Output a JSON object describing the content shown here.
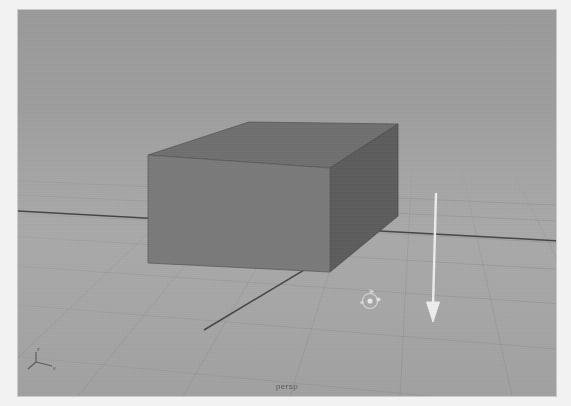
{
  "app": {
    "kind": "3d-modeling-viewport",
    "viewport_label": "persp",
    "background_color": "#a2a2a2",
    "frame_color": "#f2f2f2"
  },
  "viewport": {
    "label": "persp",
    "grid": {
      "visible": true,
      "line_color": "#8f8f8f",
      "axis_line_color": "#3a3a3a",
      "ground_color": "#a3a3a3"
    },
    "objects": [
      {
        "name": "pCube1",
        "type": "cuboid",
        "selected": false,
        "face_colors": {
          "front": "#7b7b7b",
          "top": "#6e6e6e",
          "side": "#5d5d5d"
        },
        "edge_color": "#4a4a4a"
      }
    ],
    "manipulator": {
      "name": "move-manipulator",
      "visible": true,
      "color": "#e6e6e6",
      "position_px": [
        370,
        301
      ]
    },
    "annotation": {
      "name": "down-arrow-annotation",
      "type": "arrow",
      "direction": "down",
      "color": "#f0f0f0",
      "from_px": [
        435,
        192
      ],
      "to_px": [
        433,
        318
      ]
    },
    "axis_indicator": {
      "name": "axis-orientation-indicator",
      "visible": true,
      "labels": [
        "z",
        "x"
      ],
      "color": "#4a4a4a"
    }
  }
}
